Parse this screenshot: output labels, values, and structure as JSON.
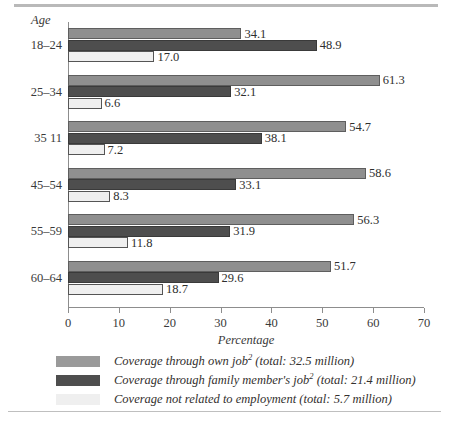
{
  "chart_data": {
    "type": "bar",
    "orientation": "horizontal",
    "title": "",
    "xlabel": "Percentage",
    "ylabel": "Age",
    "xlim": [
      0,
      70
    ],
    "xticks": [
      0,
      10,
      20,
      30,
      40,
      50,
      60,
      70
    ],
    "grid": false,
    "legend_position": "bottom",
    "categories": [
      "18–24",
      "25–34",
      "35  11",
      "45–54",
      "55–59",
      "60–64"
    ],
    "series": [
      {
        "name": "Coverage through own job",
        "footnote": "2",
        "total": "32.5 million",
        "legend_label": "Coverage through own job² (total:  32.5 million)",
        "color": "#8f8f8f",
        "values": [
          34.1,
          61.3,
          54.7,
          58.6,
          56.3,
          51.7
        ]
      },
      {
        "name": "Coverage through family member's job",
        "footnote": "2",
        "total": "21.4 million",
        "legend_label": "Coverage through family member's job² (total: 21.4 million)",
        "color": "#4e4e4e",
        "values": [
          48.9,
          32.1,
          38.1,
          33.1,
          31.9,
          29.6
        ]
      },
      {
        "name": "Coverage not related to employment",
        "footnote": "",
        "total": "5.7 million",
        "legend_label": "Coverage not related to employment (total:  5.7 million)",
        "color": "#efefef",
        "values": [
          17.0,
          6.6,
          7.2,
          8.3,
          11.8,
          18.7
        ]
      }
    ]
  },
  "legend": {
    "rows": [
      {
        "label": "Coverage through own job",
        "sup": "2",
        "tail": " (total:  32.5 million)"
      },
      {
        "label": "Coverage through family member's job",
        "sup": "2",
        "tail": " (total: 21.4 million)"
      },
      {
        "label": "Coverage not related to employment",
        "sup": "",
        "tail": " (total:  5.7 million)"
      }
    ]
  }
}
